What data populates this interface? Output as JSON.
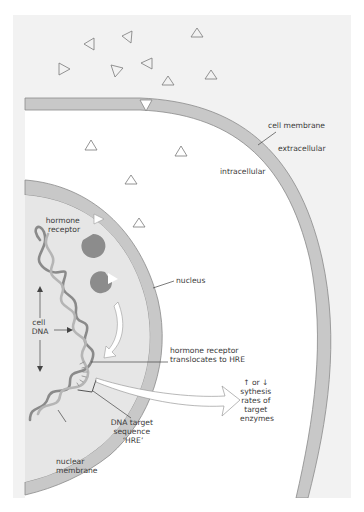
{
  "diagram": {
    "colors": {
      "background": "#ffffff",
      "extracellular_panel": "#f2f2f2",
      "intracellular": "#ffffff",
      "membrane_fill": "#c8c8c8",
      "membrane_stroke": "#8a8a8a",
      "nucleoplasm": "#e6e6e6",
      "receptor": "#8c8c8c",
      "dna_dark": "#8a8a8a",
      "dna_light": "#b5b5b5",
      "hormone_fill": "#ffffff",
      "hormone_stroke": "#7a7a7a",
      "leader_line": "#444444",
      "text": "#3a3a3a"
    },
    "labels": {
      "cell_membrane": "cell membrane",
      "extracellular": "extracellular",
      "intracellular": "intracellular",
      "hormone_receptor": [
        "hormone",
        "receptor"
      ],
      "nucleus": "nucleus",
      "cell_dna": [
        "cell",
        "DNA"
      ],
      "translocates": [
        "hormone receptor",
        "translocates to HRE"
      ],
      "synthesis": [
        "↑ or ↓",
        "sythesis",
        "rates of",
        "target",
        "enzymes"
      ],
      "dna_target": [
        "DNA target",
        "sequence",
        "‘HRE’"
      ],
      "nuclear_membrane": [
        "nuclear",
        "membrane"
      ]
    },
    "elements": {
      "hormones_extracellular": 9,
      "hormones_in_membrane": 1,
      "hormones_intracellular": 4,
      "receptors": 2
    }
  }
}
